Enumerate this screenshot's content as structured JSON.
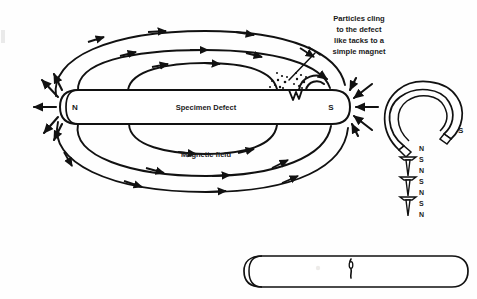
{
  "figure": {
    "background_color": "#fefefe",
    "ink_color": "#111111"
  },
  "specimen": {
    "name": "bar-specimen",
    "body_label": "Specimen Defect",
    "pole_left": "N",
    "pole_right": "S",
    "field_label": "Magnetic field",
    "defect": {
      "name": "surface-defect-notch",
      "description": "V-notch near the S pole with clinging particles"
    }
  },
  "annotation": {
    "name": "particles-callout",
    "lines": [
      "Particles cling",
      "to the defect",
      "like tacks to a",
      "simple magnet"
    ],
    "text": "Particles cling to the defect like tacks to a simple magnet"
  },
  "horseshoe": {
    "name": "horseshoe-magnet",
    "pole_label": "S",
    "tack_chain_labels": [
      "N",
      "S",
      "N",
      "S",
      "N",
      "S",
      "N"
    ],
    "tack_count": 3
  },
  "plain_bar": {
    "name": "plain-cylinder-specimen",
    "defect_label": "",
    "description": "Unmagnetized cylinder showing a fine crack at mid-length"
  },
  "field_lines": {
    "upper_arc_count": 3,
    "lower_arc_count": 3,
    "upper_inner_loop_count": 1,
    "lower_inner_loop_count": 1,
    "direction": "N to S externally"
  }
}
